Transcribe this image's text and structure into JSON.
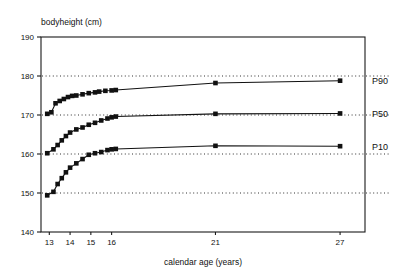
{
  "chart_data": {
    "type": "line",
    "title": "bodyheight (cm)",
    "xlabel": "calendar age (years)",
    "ylabel": "bodyheight (cm)",
    "xlim": [
      12.6,
      28.2
    ],
    "ylim": [
      140,
      190
    ],
    "x_ticks": [
      13,
      14,
      15,
      16,
      21,
      27
    ],
    "x_tick_labels": [
      "13",
      "14",
      "15",
      "16",
      "21",
      "27"
    ],
    "y_ticks": [
      140,
      150,
      160,
      170,
      180,
      190
    ],
    "y_tick_labels": [
      "140",
      "150",
      "160",
      "170",
      "180",
      "190"
    ],
    "grid": "horizontal dotted at 150, 160, 170, 180",
    "gridlines": [
      150,
      160,
      170,
      180
    ],
    "legend": "inline labels at right end of each curve",
    "series": [
      {
        "name": "P90",
        "label": "P90",
        "x": [
          12.9,
          13.1,
          13.3,
          13.5,
          13.7,
          13.9,
          14.1,
          14.3,
          14.6,
          14.9,
          15.2,
          15.4,
          15.7,
          16.0,
          16.2,
          21.0,
          27.0
        ],
        "values": [
          170.3,
          170.7,
          173.0,
          173.6,
          174.1,
          174.6,
          174.9,
          175.0,
          175.3,
          175.6,
          175.8,
          176.0,
          176.2,
          176.3,
          176.4,
          178.2,
          178.8
        ]
      },
      {
        "name": "P50",
        "label": "P50",
        "x": [
          12.9,
          13.2,
          13.4,
          13.6,
          13.8,
          14.0,
          14.3,
          14.6,
          14.9,
          15.2,
          15.5,
          15.8,
          16.0,
          16.2,
          21.0,
          27.0
        ],
        "values": [
          160.2,
          161.2,
          162.3,
          163.5,
          164.6,
          165.5,
          166.3,
          166.8,
          167.5,
          168.0,
          168.6,
          169.1,
          169.4,
          169.6,
          170.3,
          170.4
        ]
      },
      {
        "name": "P10",
        "label": "P10",
        "x": [
          12.9,
          13.2,
          13.4,
          13.6,
          13.8,
          14.0,
          14.3,
          14.6,
          14.9,
          15.2,
          15.5,
          15.8,
          16.0,
          16.2,
          21.0,
          27.0
        ],
        "values": [
          149.4,
          150.3,
          152.3,
          153.8,
          155.3,
          156.5,
          157.6,
          158.7,
          159.8,
          160.2,
          160.5,
          161.0,
          161.2,
          161.3,
          162.1,
          162.0
        ]
      }
    ]
  },
  "style": {
    "ink": "#111111",
    "background": "#ffffff"
  }
}
